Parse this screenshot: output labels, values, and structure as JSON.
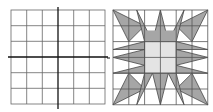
{
  "figure": {
    "left_panel": {
      "description": "6x6 square grid with coordinate axes",
      "rows": 6,
      "cols": 6
    },
    "right_panel": {
      "description": "6x6 grid with shaded star quilt pattern",
      "rows": 6,
      "cols": 6
    },
    "colors": {
      "grid": "#555555",
      "axis": "#111111",
      "dark_fill": "#a6a6a6",
      "light_fill": "#e4e4e4"
    }
  }
}
